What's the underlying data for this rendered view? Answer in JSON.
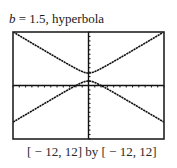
{
  "title": {
    "var": "b",
    "rest": " = 1.5, hyperbola"
  },
  "caption": "[ − 12, 12] by [ − 12, 12]",
  "colors": {
    "curve": "#111111",
    "frame": "#222222",
    "axis": "#111111",
    "background": "#ffffff"
  },
  "chart_data": {
    "type": "line",
    "title": "b = 1.5, hyperbola",
    "xlabel": "",
    "ylabel": "",
    "xlim": [
      -12,
      12
    ],
    "ylim": [
      -12,
      12
    ],
    "window_caption": "[-12, 12] by [-12, 12]",
    "grid": false,
    "axes_ticks": {
      "x_step": 1,
      "y_step": 1
    },
    "legend": null,
    "x": [
      -12,
      -11,
      -10,
      -9,
      -8,
      -7,
      -6,
      -5,
      -4,
      -3,
      -2,
      -1,
      0,
      1,
      2,
      3,
      4,
      5,
      6,
      7,
      8,
      9,
      10,
      11,
      12
    ],
    "series": [
      {
        "name": "upper branch",
        "values": [
          12.02,
          11.18,
          10.35,
          9.51,
          8.68,
          7.85,
          7.02,
          6.2,
          5.38,
          4.58,
          3.81,
          3.13,
          2.8,
          3.13,
          3.81,
          4.58,
          5.38,
          6.2,
          7.02,
          7.85,
          8.68,
          9.51,
          10.35,
          11.18,
          12.02
        ]
      },
      {
        "name": "lower branch",
        "values": [
          -8.22,
          -7.38,
          -6.55,
          -5.71,
          -4.88,
          -4.05,
          -3.22,
          -2.4,
          -1.58,
          -0.78,
          -0.01,
          0.67,
          1.0,
          0.67,
          -0.01,
          -0.78,
          -1.58,
          -2.4,
          -3.22,
          -4.05,
          -4.88,
          -5.71,
          -6.55,
          -7.38,
          -8.22
        ]
      }
    ]
  },
  "frame": {
    "left": 13,
    "top": 32,
    "right": 164,
    "bottom": 139
  }
}
